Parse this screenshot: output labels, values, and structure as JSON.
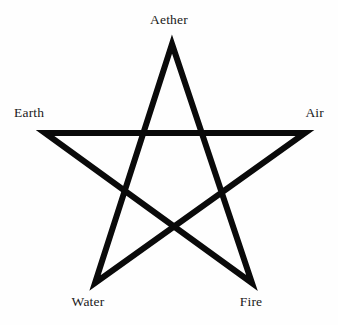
{
  "figure": {
    "background_color": "#fefefe",
    "stroke_color": "#0a0a0a",
    "label_color": "#1a1a1a",
    "stroke_width": 6
  },
  "labels": {
    "top": "Aether",
    "left": "Earth",
    "right": "Air",
    "bottom_left": "Water",
    "bottom_right": "Fire"
  },
  "chart_data": {
    "type": "diagram",
    "shape": "pentagram",
    "title": "",
    "points": [
      {
        "name": "Aether",
        "position": "top",
        "x": 172,
        "y": 44,
        "label_x": 172,
        "label_y": 23
      },
      {
        "name": "Air",
        "position": "right",
        "x": 305,
        "y": 133,
        "label_x": 315,
        "label_y": 116
      },
      {
        "name": "Fire",
        "position": "bottom-right",
        "x": 252,
        "y": 283,
        "label_x": 251,
        "label_y": 305
      },
      {
        "name": "Water",
        "position": "bottom-left",
        "x": 95,
        "y": 283,
        "label_x": 88,
        "label_y": 305
      },
      {
        "name": "Earth",
        "position": "left",
        "x": 45,
        "y": 133,
        "label_x": 22,
        "label_y": 116
      }
    ],
    "path_order": [
      "Aether",
      "Fire",
      "Earth",
      "Air",
      "Water",
      "Aether"
    ],
    "center": {
      "x": 173,
      "y": 160
    },
    "legend": []
  }
}
